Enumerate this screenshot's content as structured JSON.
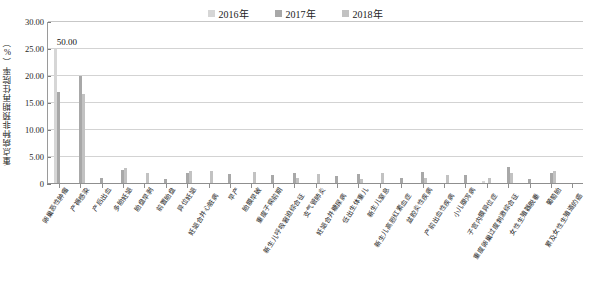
{
  "legend": {
    "position": "top-center",
    "items": [
      {
        "label": "2016年",
        "color": "#d6d6d6"
      },
      {
        "label": "2017年",
        "color": "#a8a8a8"
      },
      {
        "label": "2018年",
        "color": "#c2c2c2"
      }
    ]
  },
  "axes": {
    "ylabel": "重点病种非预期再住院率（%）",
    "xlabel": "",
    "yticks": [
      "0",
      "5.00",
      "10.00",
      "15.00",
      "20.00",
      "25.00",
      "30.00"
    ],
    "ylim": [
      0,
      30
    ],
    "grid": true
  },
  "annotations": [
    {
      "text": "50.00",
      "category": "卵巢恶性肿瘤",
      "series": "2016年"
    }
  ],
  "chart_data": {
    "type": "bar",
    "title": "",
    "subtitle": "",
    "xlabel": "",
    "ylabel": "重点病种非预期再住院率（%）",
    "ylim": [
      0,
      30
    ],
    "yticks": [
      0,
      5,
      10,
      15,
      20,
      25,
      30
    ],
    "grid": true,
    "legend_position": "top-center",
    "categories": [
      "卵巢恶性肿瘤",
      "产褥感染",
      "产后出血",
      "多胎妊娠",
      "胎盘早剥",
      "前置胎盘",
      "异位妊娠",
      "妊娠合并心脏病",
      "早产",
      "胎膜早破",
      "重度子痫前期",
      "新生儿呼吸窘迫综合征",
      "支气管肺炎",
      "妊娠合并糖尿病",
      "低出生体重儿",
      "新生儿窒息",
      "新生儿高胆红素血症",
      "盆腔炎性疾病",
      "产前出血性疾病",
      "小儿腹泻病",
      "子宫内膜异位症",
      "重度卵巢过度刺激综合征",
      "女性生殖器脱垂",
      "葡萄胎",
      "累及女性生殖道的癌"
    ],
    "series": [
      {
        "name": "2016年",
        "color": "#d6d6d6",
        "values": [
          25.0,
          0.0,
          0.0,
          0.0,
          0.0,
          0.0,
          0.0,
          0.0,
          0.0,
          0.0,
          0.0,
          0.0,
          0.0,
          0.0,
          0.0,
          0.0,
          0.0,
          0.0,
          0.0,
          0.0,
          0.5,
          0.0,
          0.0,
          0.0,
          0.0
        ],
        "note": "首列实际值为50.00，已截断显示"
      },
      {
        "name": "2017年",
        "color": "#a8a8a8",
        "values": [
          17.0,
          20.0,
          1.2,
          2.6,
          0.0,
          1.0,
          2.1,
          0.0,
          1.8,
          0.0,
          1.6,
          2.0,
          0.0,
          1.4,
          1.8,
          0.0,
          1.2,
          2.2,
          0.0,
          1.6,
          0.0,
          3.1,
          1.0,
          2.0,
          0.0
        ],
        "note": ""
      },
      {
        "name": "2018年",
        "color": "#c2c2c2",
        "values": [
          0.0,
          16.7,
          0.0,
          3.0,
          2.0,
          0.0,
          2.5,
          2.4,
          0.0,
          2.3,
          0.0,
          1.1,
          1.9,
          0.0,
          0.9,
          2.0,
          0.0,
          1.1,
          1.6,
          0.0,
          1.2,
          2.1,
          0.0,
          2.4,
          0.0
        ],
        "note": ""
      }
    ]
  }
}
